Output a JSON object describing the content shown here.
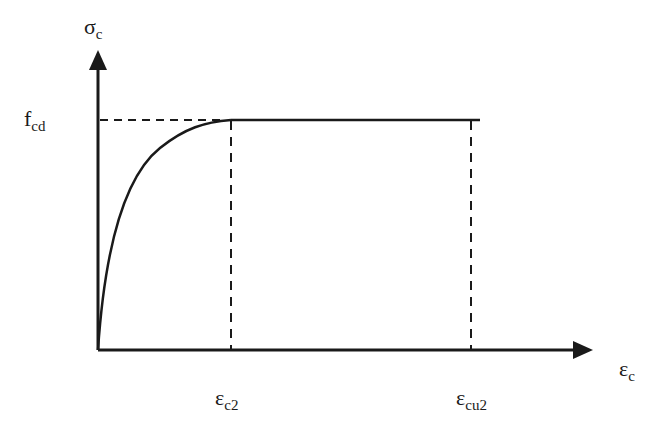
{
  "diagram": {
    "y_axis": {
      "symbol": "σ",
      "subscript": "c"
    },
    "x_axis": {
      "symbol": "ε",
      "subscript": "c"
    },
    "y_marker": {
      "symbol": "f",
      "subscript": "cd"
    },
    "x_markers": [
      {
        "symbol": "ε",
        "subscript": "c2"
      },
      {
        "symbol": "ε",
        "subscript": "cu2"
      }
    ],
    "colors": {
      "line": "#1a1a1a",
      "background": "#ffffff"
    }
  }
}
